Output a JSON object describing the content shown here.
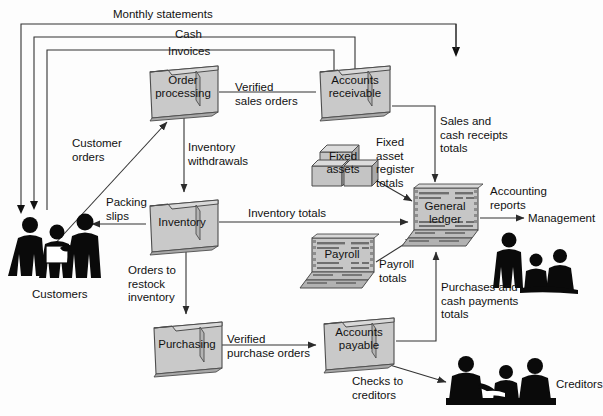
{
  "diagram": {
    "colors": {
      "line": "#333333",
      "folder_fill": "#c9c9c9",
      "folder_edge": "#4d4d4d",
      "ledger_fill": "#bdbdbd",
      "box_fill": "#c4c4c4",
      "silhouette": "#0a0a0a",
      "text": "#111111",
      "background": "#ffffff"
    },
    "nodes": [
      {
        "id": "order-processing",
        "label": "Order\nprocessing",
        "icon": "folder-icon",
        "x": 148,
        "y": 66,
        "w": 68,
        "h": 48
      },
      {
        "id": "accounts-receivable",
        "label": "Accounts\nreceivable",
        "icon": "folder-icon",
        "x": 318,
        "y": 66,
        "w": 72,
        "h": 48
      },
      {
        "id": "fixed-assets",
        "label": "Fixed\nassets",
        "icon": "boxes-icon",
        "x": 318,
        "y": 140,
        "w": 56,
        "h": 46
      },
      {
        "id": "inventory",
        "label": "Inventory",
        "icon": "folder-icon",
        "x": 148,
        "y": 200,
        "w": 68,
        "h": 48
      },
      {
        "id": "general-ledger",
        "label": "General\nledger",
        "icon": "ledger-icon",
        "x": 412,
        "y": 186,
        "w": 68,
        "h": 56
      },
      {
        "id": "payroll",
        "label": "Payroll",
        "icon": "ledger-icon",
        "x": 310,
        "y": 236,
        "w": 66,
        "h": 48
      },
      {
        "id": "purchasing",
        "label": "Purchasing",
        "icon": "folder-icon",
        "x": 152,
        "y": 322,
        "w": 70,
        "h": 48
      },
      {
        "id": "accounts-payable",
        "label": "Accounts\npayable",
        "icon": "folder-icon",
        "x": 322,
        "y": 318,
        "w": 72,
        "h": 48
      }
    ],
    "actors": [
      {
        "id": "customers",
        "label": "Customers",
        "icon": "people-group-icon",
        "x": 8,
        "y": 206
      },
      {
        "id": "management",
        "label": "Management",
        "icon": "people-group-icon",
        "x": 496,
        "y": 228
      },
      {
        "id": "creditors",
        "label": "Creditors",
        "icon": "people-group-icon",
        "x": 450,
        "y": 352
      }
    ],
    "flow_labels": [
      {
        "id": "monthly-statements",
        "text": "Monthly statements",
        "x": 113,
        "y": 8
      },
      {
        "id": "cash",
        "text": "Cash",
        "x": 175,
        "y": 28
      },
      {
        "id": "invoices",
        "text": "Invoices",
        "x": 168,
        "y": 45
      },
      {
        "id": "verified-sales-orders",
        "text": "Verified\nsales orders",
        "x": 235,
        "y": 81
      },
      {
        "id": "customer-orders",
        "text": "Customer\norders",
        "x": 72,
        "y": 137
      },
      {
        "id": "inventory-withdrawals",
        "text": "Inventory\nwithdrawals",
        "x": 188,
        "y": 141
      },
      {
        "id": "fixed-asset-register",
        "text": "Fixed\nasset\nregister\ntotals",
        "x": 376,
        "y": 136
      },
      {
        "id": "sales-cash-receipts",
        "text": "Sales and\ncash receipts\ntotals",
        "x": 440,
        "y": 115
      },
      {
        "id": "packing-slips",
        "text": "Packing\nslips",
        "x": 108,
        "y": 196
      },
      {
        "id": "inventory-totals",
        "text": "Inventory totals",
        "x": 248,
        "y": 207
      },
      {
        "id": "accounting-reports",
        "text": "Accounting\nreports",
        "x": 490,
        "y": 185
      },
      {
        "id": "payroll-totals",
        "text": "Payroll\ntotals",
        "x": 379,
        "y": 258
      },
      {
        "id": "orders-to-restock",
        "text": "Orders to\nrestock\ninventory",
        "x": 128,
        "y": 264
      },
      {
        "id": "purchases-cash-payments",
        "text": "Purchases and\ncash payments\ntotals",
        "x": 441,
        "y": 281
      },
      {
        "id": "verified-purchase-orders",
        "text": "Verified\npurchase orders",
        "x": 227,
        "y": 333
      },
      {
        "id": "checks-to-creditors",
        "text": "Checks to\ncreditors",
        "x": 352,
        "y": 375
      }
    ]
  }
}
